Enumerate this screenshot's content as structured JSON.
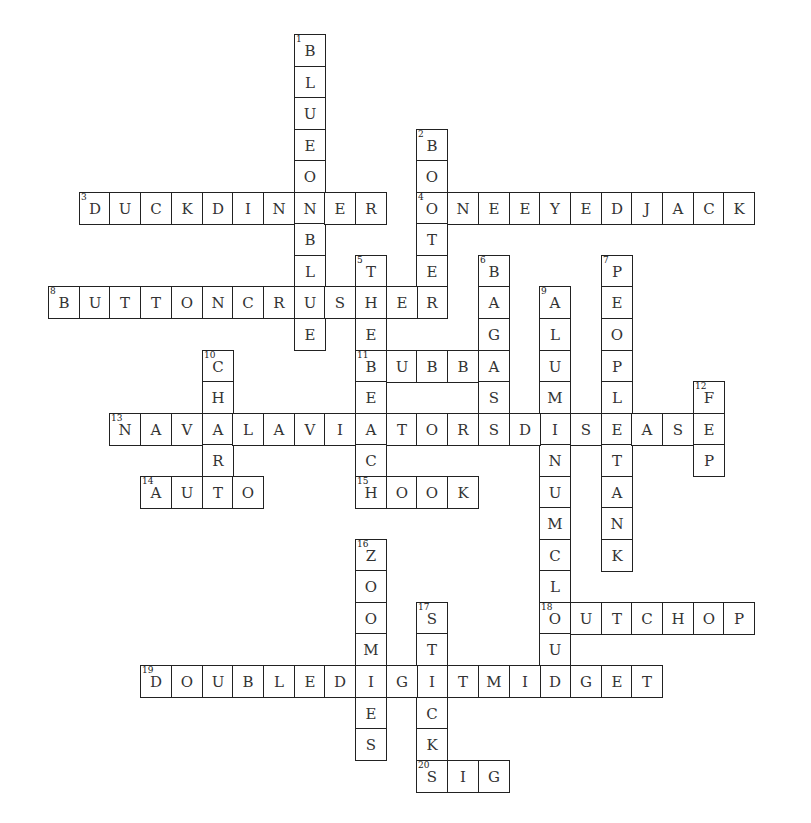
{
  "puzzle": {
    "grid": {
      "origin_x": 48,
      "origin_y": 34,
      "cell_w": 30.7,
      "cell_h": 31.55
    },
    "colors": {
      "border": "#222222",
      "letter": "#333333",
      "background": "#ffffff"
    },
    "words": [
      {
        "number": 1,
        "direction": "down",
        "answer": "BLUEONBLUE",
        "col": 8,
        "row": 0
      },
      {
        "number": 2,
        "direction": "down",
        "answer": "BOOTER",
        "col": 12,
        "row": 3
      },
      {
        "number": 3,
        "direction": "across",
        "answer": "DUCKDINNER",
        "col": 1,
        "row": 5
      },
      {
        "number": 4,
        "direction": "across",
        "answer": "ONEEYEDJACK",
        "col": 12,
        "row": 5
      },
      {
        "number": 5,
        "direction": "down",
        "answer": "THEBEACH",
        "col": 10,
        "row": 7
      },
      {
        "number": 6,
        "direction": "down",
        "answer": "BAGASS",
        "col": 14,
        "row": 7
      },
      {
        "number": 7,
        "direction": "down",
        "answer": "PEOPLETANK",
        "col": 18,
        "row": 7
      },
      {
        "number": 8,
        "direction": "across",
        "answer": "BUTTONCRUSHER",
        "col": 0,
        "row": 8
      },
      {
        "number": 9,
        "direction": "down",
        "answer": "ALUMINUMCLOUD",
        "col": 16,
        "row": 8
      },
      {
        "number": 10,
        "direction": "down",
        "answer": "CHAR",
        "col": 5,
        "row": 10
      },
      {
        "number": 11,
        "direction": "across",
        "answer": "BUBBA",
        "col": 10,
        "row": 10
      },
      {
        "number": 12,
        "direction": "down",
        "answer": "FEP",
        "col": 21,
        "row": 11
      },
      {
        "number": 13,
        "direction": "across",
        "answer": "NAVALAVIATORSDISEASE",
        "col": 2,
        "row": 12
      },
      {
        "number": 14,
        "direction": "across",
        "answer": "AUTO",
        "col": 3,
        "row": 14
      },
      {
        "number": 15,
        "direction": "across",
        "answer": "HOOK",
        "col": 10,
        "row": 14
      },
      {
        "number": 16,
        "direction": "down",
        "answer": "ZOOMIES",
        "col": 10,
        "row": 16
      },
      {
        "number": 17,
        "direction": "down",
        "answer": "STICKS",
        "col": 12,
        "row": 18
      },
      {
        "number": 18,
        "direction": "across",
        "answer": "OUTCHOP",
        "col": 16,
        "row": 18
      },
      {
        "number": 19,
        "direction": "across",
        "answer": "DOUBLEDIGITMIDGET",
        "col": 3,
        "row": 20
      },
      {
        "number": 20,
        "direction": "across",
        "answer": "SIG",
        "col": 12,
        "row": 23
      }
    ]
  }
}
